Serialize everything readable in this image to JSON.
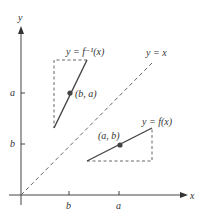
{
  "axes": {
    "x_label": "x",
    "y_label": "y",
    "x_ticks": [
      "b",
      "a"
    ],
    "y_ticks": [
      "a",
      "b"
    ]
  },
  "curves": {
    "inverse_label": "y = f⁻¹(x)",
    "function_label": "y = f(x)",
    "identity_label": "y = x"
  },
  "points": {
    "inverse_point": "(b, a)",
    "function_point": "(a, b)"
  },
  "colors": {
    "line": "#444444",
    "text": "#333333",
    "background": "#ffffff"
  }
}
